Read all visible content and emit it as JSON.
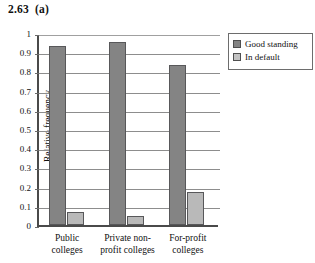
{
  "figure": {
    "title": "2.63  (a)"
  },
  "legend": {
    "position": "top-right",
    "items": [
      {
        "label": "Good standing",
        "swatch": "legend-swatch-good-standing",
        "color": "#848484"
      },
      {
        "label": "In default",
        "swatch": "legend-swatch-in-default",
        "color": "#b9b9b9"
      }
    ]
  },
  "axes": {
    "ylabel": "Relative frequency",
    "yticks": [
      "1",
      "0.9",
      "0.8",
      "0.7",
      "0.6",
      "0.5",
      "0.4",
      "0.3",
      "0.2",
      "0.1",
      "0"
    ],
    "categories": [
      {
        "line1": "Public",
        "line2": "colleges"
      },
      {
        "line1": "Private non-",
        "line2": "profit colleges"
      },
      {
        "line1": "For-profit",
        "line2": "colleges"
      }
    ]
  },
  "chart_data": {
    "type": "bar",
    "title": "2.63  (a)",
    "xlabel": "",
    "ylabel": "Relative frequency",
    "ylim": [
      0,
      1
    ],
    "ytick_step": 0.1,
    "grid": "horizontal",
    "legend_position": "top-right",
    "categories": [
      "Public colleges",
      "Private non-profit colleges",
      "For-profit colleges"
    ],
    "series": [
      {
        "name": "Good standing",
        "color": "#848484",
        "values": [
          0.93,
          0.955,
          0.835
        ]
      },
      {
        "name": "In default",
        "color": "#b9b9b9",
        "values": [
          0.07,
          0.045,
          0.17
        ]
      }
    ]
  }
}
